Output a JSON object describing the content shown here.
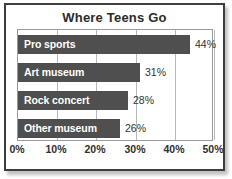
{
  "chart_data": {
    "type": "bar",
    "orientation": "horizontal",
    "title": "Where Teens Go",
    "xlabel": "",
    "ylabel": "",
    "categories": [
      "Pro sports",
      "Art museum",
      "Rock concert",
      "Other museum"
    ],
    "values": [
      44,
      31,
      28,
      26
    ],
    "value_labels": [
      "44%",
      "31%",
      "28%",
      "26%"
    ],
    "xlim": [
      0,
      50
    ],
    "xticks": [
      0,
      10,
      20,
      30,
      40,
      50
    ],
    "xtick_labels": [
      "0%",
      "10%",
      "20%",
      "30%",
      "40%",
      "50%"
    ],
    "grid": true,
    "grid_axis": "x",
    "legend": false,
    "bar_color": "#4f4f4f",
    "bar_label_color": "#ffffff",
    "value_label_color": "#333333",
    "plot_background": "#ffffff",
    "frame_color": "#3d3d3d"
  }
}
